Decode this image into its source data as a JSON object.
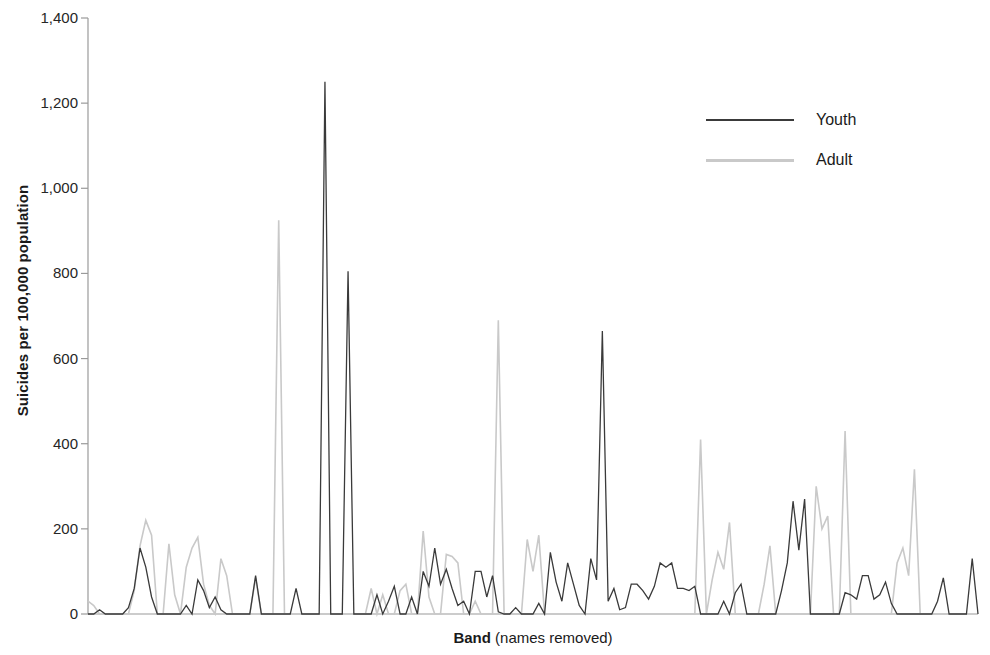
{
  "chart_data": {
    "type": "line",
    "title": "",
    "xlabel_bold": "Band",
    "xlabel_rest": " (names removed)",
    "ylabel": "Suicides per 100,000 population",
    "ylim": [
      0,
      1400
    ],
    "ytick_values": [
      0,
      200,
      400,
      600,
      800,
      1000,
      1200,
      1400
    ],
    "ytick_labels": [
      "0",
      "200",
      "400",
      "600",
      "800",
      "1,000",
      "1,200",
      "1,400"
    ],
    "xlim": [
      0,
      154
    ],
    "xticks_shown": false,
    "grid": false,
    "legend_position": "upper right",
    "colors": {
      "youth": "#3a3a3a",
      "adult": "#c9c9c9",
      "axis": "#9a9a9a"
    },
    "series": [
      {
        "name": "Youth",
        "color": "#3a3a3a",
        "values": [
          0,
          0,
          10,
          0,
          0,
          0,
          0,
          15,
          60,
          155,
          110,
          40,
          0,
          0,
          0,
          0,
          0,
          20,
          0,
          80,
          55,
          15,
          40,
          10,
          0,
          0,
          0,
          0,
          0,
          90,
          0,
          0,
          0,
          0,
          0,
          0,
          60,
          0,
          0,
          0,
          0,
          1250,
          0,
          0,
          0,
          805,
          0,
          0,
          0,
          0,
          45,
          0,
          30,
          65,
          0,
          0,
          40,
          0,
          100,
          65,
          155,
          70,
          105,
          60,
          20,
          30,
          0,
          100,
          100,
          40,
          90,
          5,
          0,
          0,
          15,
          0,
          0,
          0,
          25,
          0,
          145,
          75,
          30,
          120,
          70,
          20,
          0,
          130,
          80,
          665,
          30,
          60,
          10,
          15,
          70,
          70,
          55,
          35,
          65,
          120,
          110,
          120,
          60,
          60,
          55,
          65,
          0,
          0,
          0,
          0,
          30,
          0,
          50,
          70,
          0,
          0,
          0,
          0,
          0,
          0,
          55,
          120,
          265,
          150,
          270,
          0,
          0,
          0,
          0,
          0,
          0,
          50,
          45,
          35,
          90,
          90,
          35,
          45,
          75,
          25,
          0,
          0,
          0,
          0,
          0,
          0,
          0,
          30,
          85,
          0,
          0,
          0,
          0,
          130,
          0
        ]
      },
      {
        "name": "Adult",
        "color": "#c9c9c9",
        "values": [
          30,
          20,
          0,
          0,
          0,
          0,
          0,
          0,
          55,
          160,
          220,
          185,
          0,
          0,
          165,
          45,
          0,
          110,
          155,
          180,
          70,
          20,
          0,
          130,
          90,
          0,
          0,
          0,
          0,
          85,
          0,
          0,
          0,
          925,
          0,
          0,
          0,
          0,
          0,
          0,
          0,
          0,
          0,
          0,
          0,
          0,
          0,
          0,
          0,
          60,
          0,
          45,
          0,
          0,
          55,
          70,
          0,
          0,
          195,
          40,
          0,
          0,
          140,
          135,
          120,
          0,
          0,
          30,
          0,
          0,
          0,
          690,
          0,
          0,
          0,
          0,
          175,
          100,
          185,
          0,
          0,
          0,
          0,
          0,
          0,
          0,
          0,
          0,
          0,
          0,
          0,
          0,
          0,
          0,
          0,
          0,
          0,
          0,
          0,
          0,
          0,
          0,
          0,
          0,
          0,
          0,
          410,
          0,
          80,
          145,
          105,
          215,
          0,
          0,
          0,
          0,
          0,
          70,
          160,
          0,
          0,
          0,
          0,
          0,
          0,
          0,
          300,
          200,
          230,
          0,
          0,
          430,
          0,
          0,
          0,
          0,
          0,
          0,
          0,
          0,
          120,
          155,
          90,
          340,
          0,
          0,
          0,
          0,
          0,
          0,
          0,
          0,
          0
        ]
      }
    ]
  },
  "legend": {
    "items": [
      {
        "label": "Youth",
        "color": "#3a3a3a"
      },
      {
        "label": "Adult",
        "color": "#c9c9c9"
      }
    ]
  }
}
